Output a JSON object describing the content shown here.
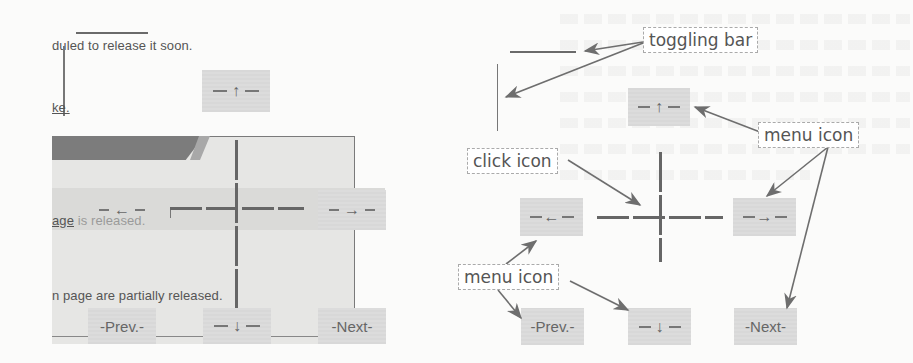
{
  "figure": {
    "left_panel": {
      "text_line_1": "duled to release it soon.",
      "text_line_2": "ke.",
      "text_line_3_link": "age",
      "text_line_3_rest": " is released.",
      "text_line_4": "n page are partially released.",
      "menu_up": {
        "arrow": "↑"
      },
      "menu_left": {
        "arrow": "←"
      },
      "menu_right": {
        "arrow": "→"
      },
      "menu_down": {
        "arrow": "↓"
      },
      "prev_label": "-Prev.-",
      "next_label": "-Next-"
    },
    "right_diagram": {
      "annotations": {
        "toggling_bar": "toggling bar",
        "menu_icon_top": "menu icon",
        "click_icon": "click icon",
        "menu_icon_bottom": "menu icon"
      },
      "menu_up": {
        "arrow": "↑"
      },
      "menu_left": {
        "arrow": "←"
      },
      "menu_right": {
        "arrow": "→"
      },
      "menu_down": {
        "arrow": "↓"
      },
      "prev_label": "-Prev.-",
      "next_label": "-Next-"
    },
    "colors": {
      "background": "#fbfbfa",
      "menu_box": "#dcdcdc",
      "header_bar": "#7c7c7c",
      "arrow_line": "#6e6e6e",
      "text": "#555555"
    }
  }
}
